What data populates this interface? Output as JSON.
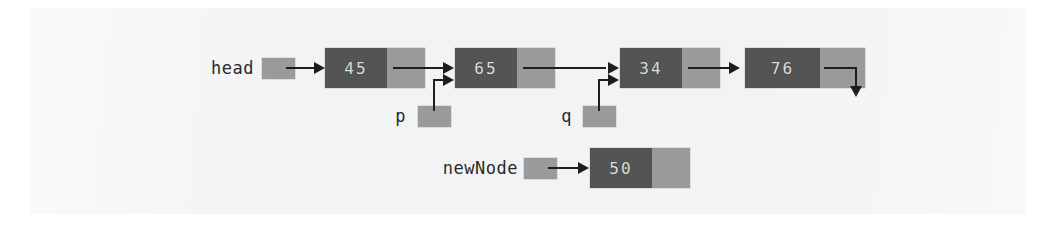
{
  "figure": {
    "kind": "linked-list-diagram",
    "colors": {
      "page_background": "#ffffff",
      "scan_background": "#f2f3f4",
      "node_data_cell": "#545454",
      "node_pointer_cell": "#9a9a9a",
      "node_value_text": "#dedede",
      "variable_box": "#9a9a9a",
      "label_text": "#2a2a2a",
      "arrow": "#1d1d1d"
    }
  },
  "list": {
    "head_label": "head",
    "nodes": [
      {
        "value": "45",
        "next": "65"
      },
      {
        "value": "65",
        "next": "34"
      },
      {
        "value": "34",
        "next": "76"
      },
      {
        "value": "76",
        "next": "null"
      }
    ]
  },
  "pointers": [
    {
      "name": "p",
      "points_to": "65"
    },
    {
      "name": "q",
      "points_to": "34"
    }
  ],
  "new_node": {
    "label": "newNode",
    "value": "50",
    "next": "null"
  }
}
